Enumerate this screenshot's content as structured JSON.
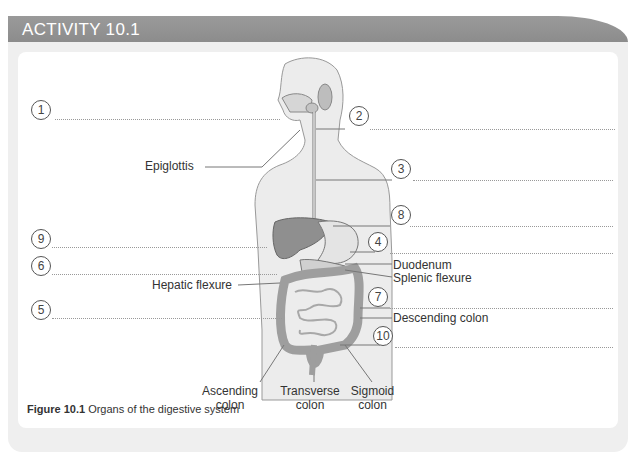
{
  "header": {
    "title": "ACTIVITY 10.1"
  },
  "figure": {
    "caption_number": "Figure 10.1",
    "caption_text": " Organs of the digestive system",
    "numbered_markers": [
      "1",
      "2",
      "3",
      "8",
      "9",
      "4",
      "6",
      "7",
      "5",
      "10"
    ],
    "labels": {
      "epiglottis": "Epiglottis",
      "hepatic_flexure": "Hepatic flexure",
      "duodenum": "Duodenum",
      "splenic_flexure": "Splenic flexure",
      "descending_colon": "Descending colon",
      "ascending_colon_1": "Ascending",
      "ascending_colon_2": "colon",
      "transverse_colon_1": "Transverse",
      "transverse_colon_2": "colon",
      "sigmoid_colon_1": "Sigmoid",
      "sigmoid_colon_2": "colon"
    },
    "colors": {
      "header_bar": "#8f8f8f",
      "outer_panel": "#efefef",
      "organ_fill": "#9a9a9a",
      "colon_fill": "#b5b5b5",
      "body_fill": "#ececec"
    }
  }
}
